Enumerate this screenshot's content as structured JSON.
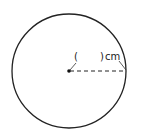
{
  "diagram": {
    "type": "circle-radius",
    "label_open": "(",
    "label_close": ")",
    "unit": "cm",
    "colors": {
      "stroke": "#222222",
      "background": "#ffffff"
    }
  }
}
